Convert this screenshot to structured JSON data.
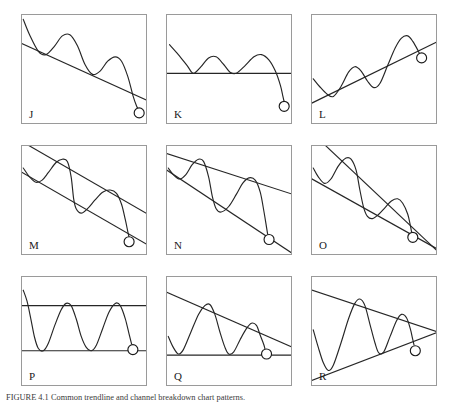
{
  "figure": {
    "width": 454,
    "height": 402,
    "background": "#ffffff",
    "border_color": "#9a9a9a",
    "line_color": "#262626",
    "marker_fill": "#ffffff",
    "caption_prefix": "FIGURE 4.1",
    "caption_text": "FIGURE 4.1   Common trendline and channel breakdown chart patterns."
  },
  "chart_data": {
    "type": "line",
    "title": "Trendline and channel breakdown chart patterns",
    "panel_count": 9,
    "grid": {
      "rows": 3,
      "cols": 3
    },
    "xlabel": "",
    "ylabel": "",
    "axis_ranges": {
      "x": [
        0,
        100
      ],
      "y": [
        0,
        100
      ]
    },
    "legend": "none",
    "panels": [
      {
        "label": "J",
        "name": "descending-trendline-breakdown",
        "description": "Falling resistance trendline with two lower highs; price breaks down below the line",
        "lines": [
          {
            "kind": "resistance",
            "style": "falling",
            "points": [
              [
                0,
                74
              ],
              [
                100,
                22
              ]
            ]
          }
        ],
        "price_points": [
          [
            1,
            96
          ],
          [
            6,
            82
          ],
          [
            13,
            67
          ],
          [
            19,
            64
          ],
          [
            26,
            72
          ],
          [
            32,
            81
          ],
          [
            38,
            82
          ],
          [
            44,
            72
          ],
          [
            50,
            55
          ],
          [
            56,
            46
          ],
          [
            62,
            49
          ],
          [
            68,
            58
          ],
          [
            74,
            62
          ],
          [
            79,
            58
          ],
          [
            84,
            44
          ],
          [
            88,
            27
          ],
          [
            91,
            17
          ],
          [
            93,
            13
          ]
        ],
        "marker": {
          "x": 93,
          "y": 11,
          "r": 5
        }
      },
      {
        "label": "K",
        "name": "horizontal-support-breakdown",
        "description": "Flat horizontal support line with three troughs; price breaks below support",
        "lines": [
          {
            "kind": "support",
            "style": "horizontal",
            "points": [
              [
                0,
                47
              ],
              [
                100,
                47
              ]
            ]
          }
        ],
        "price_points": [
          [
            2,
            73
          ],
          [
            9,
            64
          ],
          [
            16,
            54
          ],
          [
            21,
            47
          ],
          [
            27,
            53
          ],
          [
            33,
            61
          ],
          [
            39,
            62
          ],
          [
            45,
            55
          ],
          [
            50,
            48
          ],
          [
            55,
            47
          ],
          [
            62,
            54
          ],
          [
            69,
            62
          ],
          [
            75,
            64
          ],
          [
            81,
            59
          ],
          [
            86,
            49
          ],
          [
            90,
            36
          ],
          [
            92,
            26
          ],
          [
            93,
            21
          ]
        ],
        "marker": {
          "x": 93,
          "y": 17,
          "r": 5
        }
      },
      {
        "label": "L",
        "name": "rising-trendline-breakdown",
        "description": "Rising support trendline with higher highs; price breaks down through the rising line",
        "lines": [
          {
            "kind": "support",
            "style": "rising",
            "points": [
              [
                0,
                20
              ],
              [
                100,
                76
              ]
            ]
          }
        ],
        "price_points": [
          [
            1,
            42
          ],
          [
            6,
            35
          ],
          [
            12,
            28
          ],
          [
            17,
            26
          ],
          [
            23,
            35
          ],
          [
            29,
            48
          ],
          [
            34,
            53
          ],
          [
            39,
            49
          ],
          [
            44,
            40
          ],
          [
            49,
            34
          ],
          [
            54,
            38
          ],
          [
            60,
            54
          ],
          [
            66,
            70
          ],
          [
            71,
            79
          ],
          [
            76,
            81
          ],
          [
            80,
            76
          ],
          [
            84,
            68
          ],
          [
            86,
            63
          ]
        ],
        "marker": {
          "x": 87,
          "y": 61,
          "r": 5
        }
      },
      {
        "label": "M",
        "name": "parallel-descending-channel-breakdown",
        "description": "Parallel falling channel; price oscillates between the lines then breaks below the lower line",
        "lines": [
          {
            "kind": "resistance",
            "style": "falling",
            "points": [
              [
                0,
                104
              ],
              [
                100,
                38
              ]
            ]
          },
          {
            "kind": "support",
            "style": "falling",
            "points": [
              [
                0,
                76
              ],
              [
                100,
                10
              ]
            ]
          }
        ],
        "price_points": [
          [
            1,
            80
          ],
          [
            6,
            72
          ],
          [
            11,
            67
          ],
          [
            16,
            69
          ],
          [
            21,
            76
          ],
          [
            27,
            85
          ],
          [
            32,
            88
          ],
          [
            36,
            86
          ],
          [
            39,
            72
          ],
          [
            41,
            52
          ],
          [
            43,
            43
          ],
          [
            47,
            39
          ],
          [
            52,
            43
          ],
          [
            58,
            51
          ],
          [
            64,
            58
          ],
          [
            70,
            60
          ],
          [
            75,
            57
          ],
          [
            79,
            47
          ],
          [
            82,
            33
          ],
          [
            84,
            22
          ],
          [
            85,
            17
          ]
        ],
        "marker": {
          "x": 85,
          "y": 13,
          "r": 5
        }
      },
      {
        "label": "N",
        "name": "expanding-descending-channel-breakdown",
        "description": "Widening falling channel; amplitude grows then price breaks below the lower line",
        "lines": [
          {
            "kind": "resistance",
            "style": "falling",
            "points": [
              [
                0,
                93
              ],
              [
                100,
                56
              ]
            ]
          },
          {
            "kind": "support",
            "style": "falling",
            "points": [
              [
                0,
                78
              ],
              [
                100,
                2
              ]
            ]
          }
        ],
        "price_points": [
          [
            1,
            80
          ],
          [
            5,
            74
          ],
          [
            10,
            70
          ],
          [
            15,
            74
          ],
          [
            20,
            83
          ],
          [
            25,
            88
          ],
          [
            29,
            86
          ],
          [
            33,
            72
          ],
          [
            36,
            54
          ],
          [
            39,
            43
          ],
          [
            43,
            40
          ],
          [
            49,
            45
          ],
          [
            55,
            56
          ],
          [
            60,
            66
          ],
          [
            65,
            71
          ],
          [
            70,
            69
          ],
          [
            74,
            58
          ],
          [
            77,
            40
          ],
          [
            79,
            26
          ],
          [
            80,
            19
          ]
        ],
        "marker": {
          "x": 81,
          "y": 15,
          "r": 5
        }
      },
      {
        "label": "O",
        "name": "falling-wedge-breakdown",
        "description": "Converging falling wedge; amplitude shrinks then price breaks below the lower line",
        "lines": [
          {
            "kind": "resistance",
            "style": "falling",
            "points": [
              [
                0,
                112
              ],
              [
                100,
                4
              ]
            ]
          },
          {
            "kind": "support",
            "style": "falling",
            "points": [
              [
                0,
                70
              ],
              [
                100,
                6
              ]
            ]
          }
        ],
        "price_points": [
          [
            1,
            80
          ],
          [
            5,
            72
          ],
          [
            10,
            66
          ],
          [
            15,
            70
          ],
          [
            21,
            82
          ],
          [
            27,
            89
          ],
          [
            31,
            88
          ],
          [
            35,
            78
          ],
          [
            38,
            60
          ],
          [
            41,
            44
          ],
          [
            44,
            36
          ],
          [
            48,
            34
          ],
          [
            53,
            38
          ],
          [
            58,
            44
          ],
          [
            63,
            50
          ],
          [
            68,
            52
          ],
          [
            72,
            48
          ],
          [
            76,
            38
          ],
          [
            78,
            28
          ],
          [
            79,
            22
          ]
        ],
        "marker": {
          "x": 80,
          "y": 17,
          "r": 5
        }
      },
      {
        "label": "P",
        "name": "rectangle-range-support-test",
        "description": "Horizontal rectangle range; price bounces between flat resistance and flat support",
        "lines": [
          {
            "kind": "resistance",
            "style": "horizontal",
            "points": [
              [
                0,
                74
              ],
              [
                100,
                74
              ]
            ]
          },
          {
            "kind": "support",
            "style": "horizontal",
            "points": [
              [
                0,
                33
              ],
              [
                100,
                33
              ]
            ]
          }
        ],
        "price_points": [
          [
            1,
            88
          ],
          [
            4,
            78
          ],
          [
            7,
            62
          ],
          [
            10,
            45
          ],
          [
            13,
            35
          ],
          [
            17,
            33
          ],
          [
            21,
            40
          ],
          [
            26,
            56
          ],
          [
            31,
            70
          ],
          [
            35,
            76
          ],
          [
            39,
            74
          ],
          [
            43,
            62
          ],
          [
            47,
            46
          ],
          [
            51,
            36
          ],
          [
            55,
            33
          ],
          [
            59,
            38
          ],
          [
            64,
            53
          ],
          [
            69,
            68
          ],
          [
            74,
            76
          ],
          [
            78,
            74
          ],
          [
            82,
            62
          ],
          [
            85,
            48
          ],
          [
            87,
            39
          ]
        ],
        "marker": {
          "x": 88,
          "y": 34,
          "r": 5
        }
      },
      {
        "label": "Q",
        "name": "descending-triangle-support-test",
        "description": "Descending triangle: falling resistance line meeting flat horizontal support",
        "lines": [
          {
            "kind": "resistance",
            "style": "falling",
            "points": [
              [
                0,
                86
              ],
              [
                100,
                36
              ]
            ]
          },
          {
            "kind": "support",
            "style": "horizontal",
            "points": [
              [
                0,
                29
              ],
              [
                100,
                29
              ]
            ]
          }
        ],
        "price_points": [
          [
            1,
            46
          ],
          [
            5,
            36
          ],
          [
            9,
            30
          ],
          [
            13,
            34
          ],
          [
            19,
            50
          ],
          [
            25,
            66
          ],
          [
            30,
            74
          ],
          [
            34,
            75
          ],
          [
            38,
            66
          ],
          [
            42,
            50
          ],
          [
            46,
            36
          ],
          [
            49,
            30
          ],
          [
            53,
            32
          ],
          [
            58,
            43
          ],
          [
            63,
            53
          ],
          [
            67,
            58
          ],
          [
            71,
            56
          ],
          [
            74,
            47
          ],
          [
            77,
            38
          ],
          [
            78,
            33
          ]
        ],
        "marker": {
          "x": 79,
          "y": 30,
          "r": 5
        }
      },
      {
        "label": "R",
        "name": "symmetrical-triangle-breakdown",
        "description": "Symmetrical triangle converging to an apex; swings narrow toward the apex",
        "lines": [
          {
            "kind": "resistance",
            "style": "falling",
            "points": [
              [
                0,
                88
              ],
              [
                100,
                50
              ]
            ]
          },
          {
            "kind": "support",
            "style": "rising",
            "points": [
              [
                0,
                6
              ],
              [
                100,
                50
              ]
            ]
          }
        ],
        "price_points": [
          [
            1,
            52
          ],
          [
            5,
            36
          ],
          [
            9,
            22
          ],
          [
            13,
            15
          ],
          [
            17,
            20
          ],
          [
            23,
            40
          ],
          [
            29,
            62
          ],
          [
            34,
            76
          ],
          [
            38,
            80
          ],
          [
            42,
            74
          ],
          [
            46,
            57
          ],
          [
            50,
            40
          ],
          [
            53,
            31
          ],
          [
            57,
            32
          ],
          [
            62,
            46
          ],
          [
            67,
            60
          ],
          [
            71,
            66
          ],
          [
            75,
            63
          ],
          [
            78,
            53
          ],
          [
            80,
            43
          ],
          [
            81,
            38
          ]
        ],
        "marker": {
          "x": 82,
          "y": 33,
          "r": 5
        }
      }
    ]
  }
}
